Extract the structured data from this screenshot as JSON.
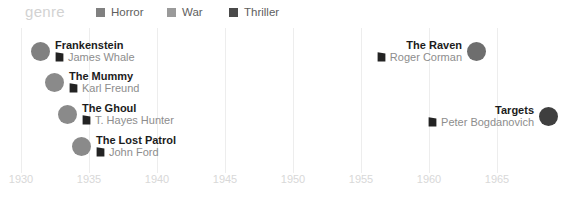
{
  "legend": {
    "title": "genre",
    "items": [
      {
        "label": "Horror",
        "color": "#808080",
        "x": 96
      },
      {
        "label": "War",
        "color": "#9a9a9a",
        "x": 167
      },
      {
        "label": "Thriller",
        "color": "#4a4a4a",
        "x": 229
      }
    ]
  },
  "axis": {
    "ticks": [
      {
        "label": "1930",
        "year": 1930,
        "x": 21
      },
      {
        "label": "1935",
        "year": 1935,
        "x": 89
      },
      {
        "label": "1940",
        "year": 1940,
        "x": 157
      },
      {
        "label": "1945",
        "year": 1945,
        "x": 225
      },
      {
        "label": "1950",
        "year": 1950,
        "x": 293
      },
      {
        "label": "1955",
        "year": 1955,
        "x": 361
      },
      {
        "label": "1960",
        "year": 1960,
        "x": 429
      },
      {
        "label": "1965",
        "year": 1965,
        "x": 497
      }
    ]
  },
  "films": [
    {
      "title": "Frankenstein",
      "director": "James Whale",
      "genre": "Horror",
      "year": 1931,
      "color": "#808080",
      "side": "left",
      "dot_x": 40,
      "dot_y": 54,
      "icon": "film-marker-icon"
    },
    {
      "title": "The Mummy",
      "director": "Karl Freund",
      "genre": "Horror",
      "year": 1932,
      "color": "#8a8a8a",
      "side": "left",
      "dot_x": 54,
      "dot_y": 85,
      "icon": "film-marker-icon"
    },
    {
      "title": "The Ghoul",
      "director": "T. Hayes Hunter",
      "genre": "Horror",
      "year": 1933,
      "color": "#8a8a8a",
      "side": "left",
      "dot_x": 67,
      "dot_y": 117,
      "icon": "film-marker-icon"
    },
    {
      "title": "The Lost Patrol",
      "director": "John Ford",
      "genre": "War",
      "year": 1934,
      "color": "#8a8a8a",
      "side": "left",
      "dot_x": 81,
      "dot_y": 149,
      "icon": "film-marker-icon"
    },
    {
      "title": "The Raven",
      "director": "Roger Corman",
      "genre": "Horror",
      "year": 1963,
      "color": "#6e6e6e",
      "side": "right",
      "dot_x": 476,
      "dot_y": 54,
      "icon": "film-marker-icon"
    },
    {
      "title": "Targets",
      "director": "Peter Bogdanovich",
      "genre": "Thriller",
      "year": 1968,
      "color": "#3f3f3f",
      "side": "right",
      "dot_x": 548,
      "dot_y": 119,
      "icon": "film-marker-icon"
    }
  ],
  "chart_data": {
    "type": "scatter",
    "title": "",
    "xlabel": "",
    "ylabel": "",
    "xlim": [
      1930,
      1970
    ],
    "grid": true,
    "legend_position": "top",
    "legend_title": "genre",
    "categories": [
      "Horror",
      "War",
      "Thriller"
    ],
    "xticks": [
      1930,
      1935,
      1940,
      1945,
      1950,
      1955,
      1960,
      1965
    ],
    "points": [
      {
        "label": "Frankenstein",
        "annotation": "James Whale",
        "x": 1931,
        "y": 1,
        "series": "Horror"
      },
      {
        "label": "The Mummy",
        "annotation": "Karl Freund",
        "x": 1932,
        "y": 2,
        "series": "Horror"
      },
      {
        "label": "The Ghoul",
        "annotation": "T. Hayes Hunter",
        "x": 1933,
        "y": 3,
        "series": "Horror"
      },
      {
        "label": "The Lost Patrol",
        "annotation": "John Ford",
        "x": 1934,
        "y": 4,
        "series": "War"
      },
      {
        "label": "The Raven",
        "annotation": "Roger Corman",
        "x": 1963,
        "y": 1,
        "series": "Horror"
      },
      {
        "label": "Targets",
        "annotation": "Peter Bogdanovich",
        "x": 1968,
        "y": 3,
        "series": "Thriller"
      }
    ]
  }
}
